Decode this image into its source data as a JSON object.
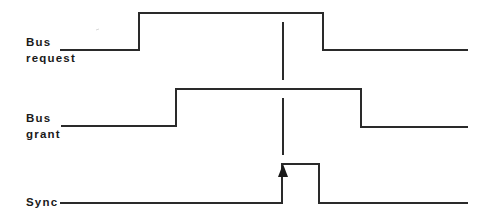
{
  "diagram": {
    "type": "timing-diagram",
    "signals": [
      {
        "name": "bus-request",
        "label_line1": "Bus",
        "label_line2": "request",
        "low_y": 50,
        "high_y": 13,
        "points": "60,50 139,50 139,13 323,13 323,50 468,50"
      },
      {
        "name": "bus-grant",
        "label_line1": "Bus",
        "label_line2": "grant",
        "low_y": 127,
        "high_y": 89,
        "points": "61,126 176,126 176,89 361,89 361,127 468,127"
      },
      {
        "name": "sync",
        "label_line1": "Sync",
        "low_y": 203,
        "high_y": 164,
        "points": "60,203 282,203 282,164 319,164 319,203 468,203"
      }
    ],
    "sync_marker": {
      "x": 283,
      "segments": [
        [
          22,
          80
        ],
        [
          98,
          155
        ]
      ],
      "arrow": "up-arrow at sync rising edge"
    },
    "colors": {
      "line": "#2a2a2a",
      "text": "#1a1a1a",
      "background": "#ffffff"
    }
  }
}
